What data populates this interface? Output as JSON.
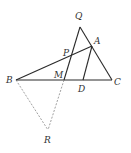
{
  "diagram": {
    "type": "geometry",
    "points": {
      "Q": {
        "label": "Q",
        "x": 80,
        "y": 27,
        "lx": 75,
        "ly": 19
      },
      "A": {
        "label": "A",
        "x": 92,
        "y": 46,
        "lx": 94,
        "ly": 44
      },
      "P": {
        "label": "P",
        "x": 72,
        "y": 57,
        "lx": 63,
        "ly": 56
      },
      "B": {
        "label": "B",
        "x": 16,
        "y": 80,
        "lx": 6,
        "ly": 83
      },
      "M": {
        "label": "M",
        "x": 64,
        "y": 80,
        "lx": 54,
        "ly": 78
      },
      "D": {
        "label": "D",
        "x": 83,
        "y": 80,
        "lx": 78,
        "ly": 92
      },
      "C": {
        "label": "C",
        "x": 112,
        "y": 80,
        "lx": 114,
        "ly": 85
      },
      "R": {
        "label": "R",
        "x": 48,
        "y": 130,
        "lx": 44,
        "ly": 143
      }
    },
    "solid_segments": [
      [
        "Q",
        "C"
      ],
      [
        "Q",
        "M"
      ],
      [
        "B",
        "A"
      ],
      [
        "B",
        "C"
      ],
      [
        "A",
        "D"
      ]
    ],
    "dashed_segments": [
      [
        "B",
        "R"
      ],
      [
        "M",
        "R"
      ]
    ],
    "colors": {
      "line": "#2a2a2a",
      "dashed": "#777777",
      "label": "#333333"
    }
  }
}
